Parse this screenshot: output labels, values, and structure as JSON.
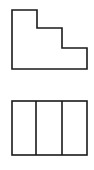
{
  "diagram": {
    "stroke_color": "#1a1a1a",
    "background": "#ffffff",
    "views": [
      {
        "name": "front-view",
        "shape": "stepped-profile",
        "points": [
          [
            12,
            10
          ],
          [
            37,
            10
          ],
          [
            37,
            28
          ],
          [
            62,
            28
          ],
          [
            62,
            48
          ],
          [
            87,
            48
          ],
          [
            87,
            69
          ],
          [
            12,
            69
          ]
        ]
      },
      {
        "name": "top-view",
        "shape": "rectangle-three-sections",
        "rect": {
          "x": 12,
          "y": 101,
          "width": 75,
          "height": 54
        },
        "dividers_x": [
          36,
          62
        ]
      }
    ]
  }
}
